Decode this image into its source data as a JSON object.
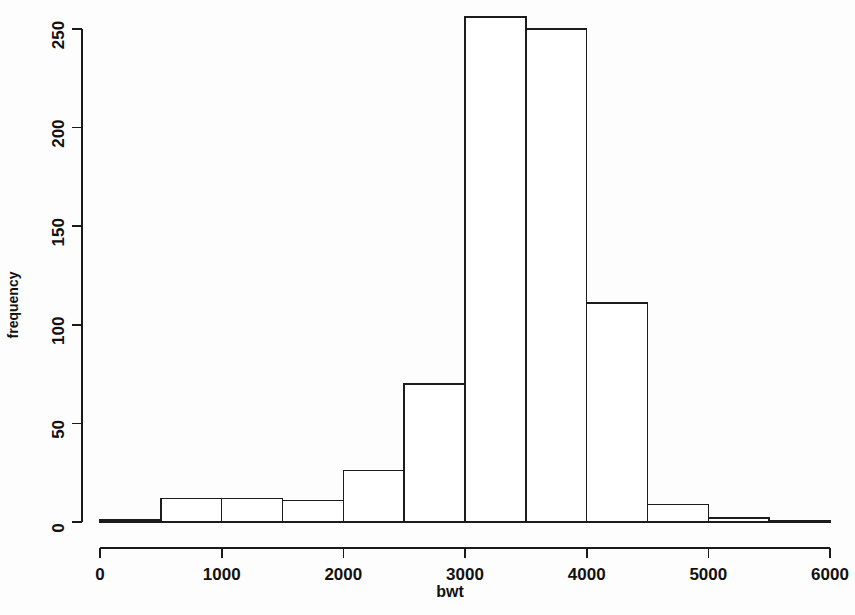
{
  "chart_data": {
    "type": "bar",
    "subtype": "histogram",
    "title": "",
    "xlabel": "bwt",
    "ylabel": "frequency",
    "xlim": [
      0,
      6000
    ],
    "ylim": [
      0,
      260
    ],
    "grid": false,
    "legend": null,
    "bin_width": 500,
    "bin_edges": [
      0,
      500,
      1000,
      1500,
      2000,
      2500,
      3000,
      3500,
      4000,
      4500,
      5000,
      5500,
      6000
    ],
    "categories": [
      "0-500",
      "500-1000",
      "1000-1500",
      "1500-2000",
      "2000-2500",
      "2500-3000",
      "3000-3500",
      "3500-4000",
      "4000-4500",
      "4500-5000",
      "5000-5500",
      "5500-6000"
    ],
    "values": [
      1,
      12,
      12,
      11,
      26,
      70,
      256,
      250,
      111,
      9,
      2,
      0
    ],
    "x_ticks": [
      0,
      1000,
      2000,
      3000,
      4000,
      5000,
      6000
    ],
    "x_tick_labels": [
      "0",
      "1000",
      "2000",
      "3000",
      "4000",
      "5000",
      "6000"
    ],
    "y_ticks": [
      0,
      50,
      100,
      150,
      200,
      250
    ],
    "y_tick_labels": [
      "0",
      "50",
      "100",
      "150",
      "200",
      "250"
    ],
    "axis_color": "#1a1a1a",
    "bar_fill": "#ffffff",
    "bar_stroke": "#1c1c1c",
    "background": "#fdfdfd"
  }
}
